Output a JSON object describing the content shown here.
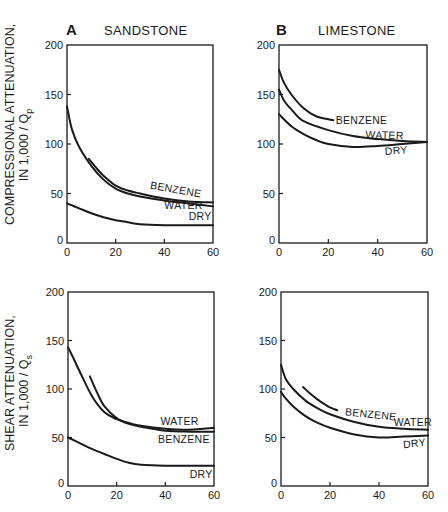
{
  "figure": {
    "row_labels": {
      "top": {
        "line1": "COMPRESSIONAL ATTENUATION,",
        "line2": "IN 1,000 / Q",
        "sub": "p"
      },
      "bottom": {
        "line1": "SHEAR ATTENUATION,",
        "line2": "IN 1,000 / Q",
        "sub": "s"
      }
    },
    "column_headers": [
      {
        "letter": "A",
        "title": "SANDSTONE"
      },
      {
        "letter": "B",
        "title": "LIMESTONE"
      }
    ]
  },
  "chart_data": [
    {
      "id": "A-compressional",
      "type": "line",
      "panel": "A",
      "title": "SANDSTONE",
      "ylabel": "COMPRESSIONAL ATTENUATION, IN 1,000 / Qp",
      "xlabel": "",
      "xlim": [
        0,
        60
      ],
      "ylim": [
        0,
        200
      ],
      "xticks": [
        0,
        20,
        40,
        60
      ],
      "yticks": [
        0,
        50,
        100,
        150,
        200
      ],
      "grid": false,
      "series": [
        {
          "name": "BENZENE",
          "x": [
            9,
            12,
            15,
            20,
            25,
            30,
            40,
            50,
            60
          ],
          "values": [
            85,
            76,
            68,
            58,
            53,
            50,
            45,
            42,
            41
          ]
        },
        {
          "name": "WATER",
          "x": [
            0,
            2,
            5,
            10,
            15,
            20,
            25,
            30,
            40,
            50,
            60
          ],
          "values": [
            138,
            115,
            97,
            78,
            64,
            55,
            50,
            47,
            43,
            40,
            37
          ]
        },
        {
          "name": "DRY",
          "x": [
            0,
            5,
            10,
            15,
            20,
            25,
            30,
            40,
            50,
            60
          ],
          "values": [
            40,
            35,
            30,
            26,
            23,
            21,
            19,
            18,
            18,
            18
          ]
        }
      ],
      "annotations": [
        {
          "text": "BENZENE",
          "x": 34,
          "y": 55,
          "rotate": 10
        },
        {
          "text": "WATER",
          "x": 40,
          "y": 34,
          "rotate": 0
        },
        {
          "text": "DRY",
          "x": 50,
          "y": 23,
          "rotate": 0
        }
      ]
    },
    {
      "id": "B-compressional",
      "type": "line",
      "panel": "B",
      "title": "LIMESTONE",
      "ylabel": "",
      "xlabel": "",
      "xlim": [
        0,
        60
      ],
      "ylim": [
        0,
        200
      ],
      "xticks": [
        0,
        20,
        40,
        60
      ],
      "yticks": [
        0,
        50,
        100,
        150,
        200
      ],
      "grid": false,
      "series": [
        {
          "name": "BENZENE",
          "x": [
            0,
            2,
            5,
            10,
            15,
            20,
            22
          ],
          "values": [
            175,
            162,
            150,
            136,
            128,
            125,
            124
          ]
        },
        {
          "name": "WATER",
          "x": [
            0,
            2,
            5,
            10,
            20,
            30,
            40,
            50,
            60
          ],
          "values": [
            155,
            144,
            135,
            123,
            114,
            108,
            105,
            103,
            102
          ]
        },
        {
          "name": "DRY",
          "x": [
            0,
            5,
            10,
            15,
            20,
            30,
            40,
            50,
            60
          ],
          "values": [
            130,
            118,
            110,
            104,
            100,
            97,
            98,
            100,
            102
          ]
        }
      ],
      "annotations": [
        {
          "text": "BENZENE",
          "x": 23,
          "y": 120,
          "rotate": 0
        },
        {
          "text": "WATER",
          "x": 35,
          "y": 106,
          "rotate": 2
        },
        {
          "text": "DRY",
          "x": 43,
          "y": 89,
          "rotate": -4
        }
      ]
    },
    {
      "id": "A-shear",
      "type": "line",
      "panel": "A",
      "title": "",
      "ylabel": "SHEAR ATTENUATION, IN 1,000 / Qs",
      "xlabel": "",
      "xlim": [
        0,
        60
      ],
      "ylim": [
        0,
        200
      ],
      "xticks": [
        0,
        20,
        40,
        60
      ],
      "yticks": [
        0,
        50,
        100,
        150,
        200
      ],
      "grid": false,
      "series": [
        {
          "name": "WATER",
          "x": [
            0,
            2,
            5,
            10,
            15,
            20,
            25,
            30,
            40,
            50,
            60
          ],
          "values": [
            143,
            133,
            117,
            92,
            76,
            69,
            65,
            62,
            59,
            58,
            60
          ]
        },
        {
          "name": "BENZENE",
          "x": [
            9,
            12,
            15,
            20,
            25,
            30,
            40,
            50,
            60
          ],
          "values": [
            113,
            96,
            82,
            70,
            64,
            61,
            57,
            56,
            56
          ]
        },
        {
          "name": "DRY",
          "x": [
            0,
            5,
            10,
            15,
            20,
            25,
            30,
            40,
            50,
            60
          ],
          "values": [
            50,
            44,
            38,
            33,
            28,
            24,
            22,
            21,
            21,
            21
          ]
        }
      ],
      "annotations": [
        {
          "text": "WATER",
          "x": 38,
          "y": 63,
          "rotate": 0
        },
        {
          "text": "BENZENE",
          "x": 37,
          "y": 44,
          "rotate": 0
        },
        {
          "text": "DRY",
          "x": 50,
          "y": 8,
          "rotate": 0
        }
      ]
    },
    {
      "id": "B-shear",
      "type": "line",
      "panel": "B",
      "title": "",
      "ylabel": "",
      "xlabel": "",
      "xlim": [
        0,
        60
      ],
      "ylim": [
        0,
        200
      ],
      "xticks": [
        0,
        20,
        40,
        60
      ],
      "yticks": [
        0,
        50,
        100,
        150,
        200
      ],
      "grid": false,
      "series": [
        {
          "name": "BENZENE",
          "x": [
            9,
            12,
            15,
            18,
            20,
            23
          ],
          "values": [
            102,
            95,
            89,
            84,
            81,
            78
          ]
        },
        {
          "name": "WATER",
          "x": [
            0,
            2,
            5,
            10,
            15,
            20,
            30,
            40,
            50,
            60
          ],
          "values": [
            125,
            110,
            100,
            88,
            80,
            74,
            66,
            61,
            59,
            58
          ]
        },
        {
          "name": "DRY",
          "x": [
            0,
            2,
            5,
            10,
            15,
            20,
            30,
            40,
            50,
            60
          ],
          "values": [
            97,
            90,
            82,
            72,
            65,
            60,
            53,
            50,
            51,
            52
          ]
        }
      ],
      "annotations": [
        {
          "text": "BENZENE",
          "x": 26,
          "y": 73,
          "rotate": 6
        },
        {
          "text": "WATER",
          "x": 46,
          "y": 62,
          "rotate": 0
        },
        {
          "text": "DRY",
          "x": 50,
          "y": 39,
          "rotate": -6
        }
      ]
    }
  ],
  "layout": {
    "panels": [
      {
        "left": 67,
        "right": 213,
        "top": 45,
        "bottom": 243
      },
      {
        "left": 279,
        "right": 427,
        "top": 45,
        "bottom": 243
      },
      {
        "left": 68,
        "right": 214,
        "top": 292,
        "bottom": 486
      },
      {
        "left": 281,
        "right": 428,
        "top": 292,
        "bottom": 486
      }
    ],
    "line_color": "#1a1a1a"
  }
}
